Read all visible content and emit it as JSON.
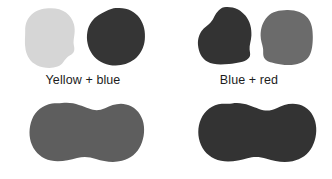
{
  "figure": {
    "background_color": "#ffffff",
    "width": 332,
    "height": 179,
    "groups": [
      {
        "id": "yellow-blue",
        "caption": "Yellow + blue",
        "blobs": [
          {
            "name": "light-gray-rounded-blob",
            "fill": "#d6d6d6",
            "shape": "rounded-irregular",
            "width": 58,
            "height": 62
          },
          {
            "name": "dark-gray-round-blob",
            "fill": "#353535",
            "shape": "round-irregular",
            "width": 62,
            "height": 60
          }
        ]
      },
      {
        "id": "blue-red",
        "caption": "Blue + red",
        "blobs": [
          {
            "name": "dark-gray-round-blob",
            "fill": "#333333",
            "shape": "round-irregular",
            "width": 62,
            "height": 62
          },
          {
            "name": "medium-gray-rounded-blob",
            "fill": "#6b6b6b",
            "shape": "rounded-square-irregular",
            "width": 58,
            "height": 58
          }
        ]
      },
      {
        "id": "bottom-row",
        "caption": "",
        "blobs": [
          {
            "name": "medium-gray-peanut-blob",
            "fill": "#5e5e5e",
            "shape": "peanut",
            "width": 118,
            "height": 66
          },
          {
            "name": "dark-gray-peanut-blob",
            "fill": "#333333",
            "shape": "peanut",
            "width": 122,
            "height": 66
          }
        ]
      }
    ]
  },
  "captions": {
    "yellow_blue": "Yellow + blue",
    "blue_red": "Blue + red"
  },
  "colors": {
    "background": "#ffffff",
    "text": "#1c1c1c",
    "light_gray": "#d6d6d6",
    "dark_gray": "#353535",
    "darkest_gray": "#333333",
    "medium_gray": "#6b6b6b",
    "mid_gray": "#5e5e5e"
  }
}
